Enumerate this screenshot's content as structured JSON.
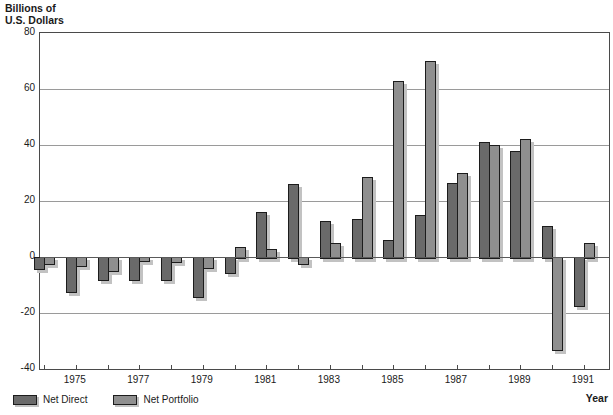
{
  "header": {
    "title_line1": "Billions of",
    "title_line2": "U.S. Dollars"
  },
  "axis": {
    "x_title": "Year"
  },
  "colors": {
    "net_direct": "#6a6a6a",
    "net_portfolio": "#8f8f8f",
    "bar_shadow": "#c2c2c2",
    "grid": "#9a9a9a",
    "frame": "#4a4a4a"
  },
  "chart_data": {
    "type": "bar",
    "title": "Billions of U.S. Dollars",
    "xlabel": "Year",
    "ylabel": "Billions of U.S. Dollars",
    "ylim": [
      -40,
      80
    ],
    "y_ticks": [
      80,
      60,
      40,
      20,
      0,
      -20,
      -40
    ],
    "grid": true,
    "legend_position": "bottom-left",
    "categories": [
      1974,
      1975,
      1976,
      1977,
      1978,
      1979,
      1980,
      1981,
      1982,
      1983,
      1984,
      1985,
      1986,
      1987,
      1988,
      1989,
      1990,
      1991
    ],
    "x_labeled_years": [
      1975,
      1977,
      1979,
      1981,
      1983,
      1985,
      1987,
      1989,
      1991
    ],
    "series": [
      {
        "name": "Net Direct",
        "values": [
          -4,
          -12,
          -8,
          -8,
          -8,
          -14,
          -5.5,
          16,
          26,
          13,
          13.5,
          6,
          15,
          26.5,
          41,
          38,
          11,
          -17
        ]
      },
      {
        "name": "Net Portfolio",
        "values": [
          -2,
          -3,
          -4.5,
          -1,
          -1.5,
          -3.5,
          3.5,
          3,
          -2,
          5,
          28.5,
          63,
          70,
          30,
          40,
          42,
          -33,
          5
        ]
      }
    ]
  }
}
